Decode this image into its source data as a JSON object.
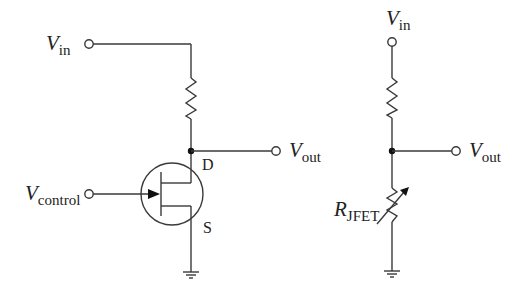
{
  "diagram": {
    "type": "circuit-schematic",
    "left_circuit": {
      "description": "JFET voltage-controlled resistor circuit",
      "vin": {
        "main": "V",
        "sub": "in"
      },
      "vout": {
        "main": "V",
        "sub": "out"
      },
      "vcontrol": {
        "main": "V",
        "sub": "control"
      },
      "drain_label": "D",
      "source_label": "S",
      "components": [
        "resistor",
        "n-channel JFET",
        "ground"
      ]
    },
    "right_circuit": {
      "description": "Equivalent voltage divider with variable resistor",
      "vin": {
        "main": "V",
        "sub": "in"
      },
      "vout": {
        "main": "V",
        "sub": "out"
      },
      "rjfet": {
        "main": "R",
        "sub": "JFET"
      },
      "components": [
        "resistor",
        "variable resistor",
        "ground"
      ]
    },
    "colors": {
      "line": "#3a3a3a",
      "background": "#ffffff"
    }
  }
}
